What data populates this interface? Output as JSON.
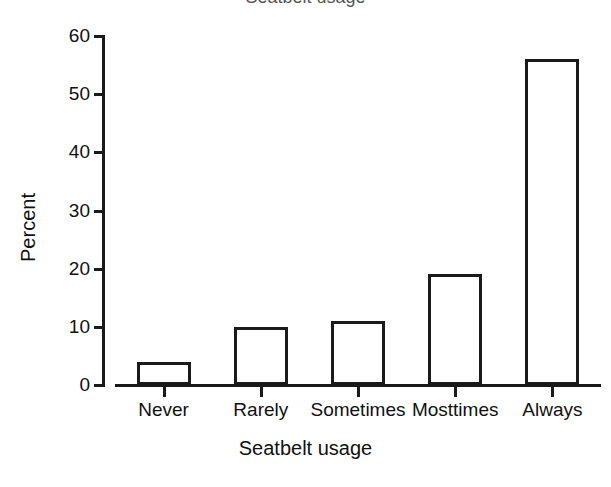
{
  "chart_data": {
    "type": "bar",
    "title": "",
    "categories": [
      "Never",
      "Rarely",
      "Sometimes",
      "Mosttimes",
      "Always"
    ],
    "values": [
      4,
      10,
      11,
      19,
      56
    ],
    "xlabel": "Seatbelt usage",
    "ylabel": "Percent",
    "ylim": [
      0,
      60
    ],
    "yticks": [
      0,
      10,
      20,
      30,
      40,
      50,
      60
    ],
    "ytick_labels": [
      "0",
      "10",
      "20",
      "30",
      "40",
      "50",
      "60"
    ],
    "grid": false,
    "legend": false,
    "bar_fill": "#ffffff",
    "bar_edge": "#1a1a1a",
    "background": "#ffffff"
  },
  "axes": {
    "y_title": "Percent",
    "x_title": "Seatbelt usage"
  },
  "title_sliver": {
    "text": "Seatbelt usage"
  }
}
